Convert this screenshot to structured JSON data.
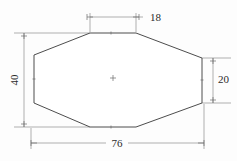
{
  "drawing": {
    "title": "Octagonal plate dimensioned drawing",
    "background_color": "#fdfdfd",
    "outline_color": "#4d4d4d",
    "dimension_color": "#8c8c8c",
    "text_color": "#2b2b2b",
    "shape": {
      "name": "octagon",
      "vertices": [
        {
          "x": 90,
          "y": 33
        },
        {
          "x": 136,
          "y": 33
        },
        {
          "x": 202,
          "y": 58
        },
        {
          "x": 202,
          "y": 103
        },
        {
          "x": 136,
          "y": 127
        },
        {
          "x": 90,
          "y": 127
        },
        {
          "x": 34,
          "y": 103
        },
        {
          "x": 34,
          "y": 55
        }
      ],
      "center_mark": {
        "x": 113,
        "y": 78
      }
    },
    "dimensions": [
      {
        "id": "top-width",
        "label": "18",
        "orientation": "horizontal",
        "position": "top",
        "text_anchor": "start",
        "text_x": 148,
        "text_y": 18,
        "line_y": 17,
        "from_x": 90,
        "to_x": 136,
        "ext_from": {
          "x": 90,
          "y1": 13,
          "y2": 32
        },
        "ext_to": {
          "x": 136,
          "y1": 13,
          "y2": 32
        }
      },
      {
        "id": "left-height",
        "label": "40",
        "orientation": "vertical",
        "position": "left",
        "rotated": true,
        "text_x": 16,
        "text_y": 80,
        "line_x": 24,
        "from_y": 33,
        "to_y": 127,
        "ext_top": {
          "y": 33,
          "x1": 14,
          "x2": 90
        },
        "ext_bottom": {
          "y": 127,
          "x1": 14,
          "x2": 90
        }
      },
      {
        "id": "right-height",
        "label": "20",
        "orientation": "vertical",
        "position": "right",
        "rotated": false,
        "text_x": 223,
        "text_y": 80,
        "line_x": 213,
        "from_y": 58,
        "to_y": 103,
        "ext_top": {
          "y": 58,
          "x1": 202,
          "x2": 230
        },
        "ext_bottom": {
          "y": 103,
          "x1": 202,
          "x2": 230
        }
      },
      {
        "id": "bottom-width",
        "label": "76",
        "orientation": "horizontal",
        "position": "bottom",
        "text_anchor": "middle",
        "text_x": 117,
        "text_y": 143,
        "line_y": 143,
        "from_x": 31,
        "to_x": 204,
        "ext_from": {
          "x": 31,
          "y1": 128,
          "y2": 148
        },
        "ext_to": {
          "x": 204,
          "y1": 104,
          "y2": 148
        }
      }
    ]
  }
}
